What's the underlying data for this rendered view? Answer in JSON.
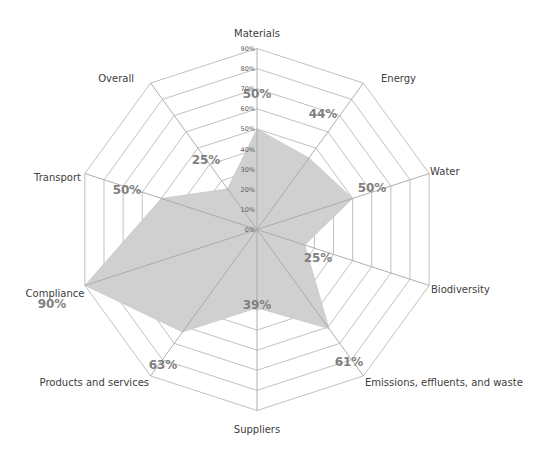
{
  "chart_data": {
    "type": "radar",
    "title": "",
    "categories": [
      "Materials",
      "Energy",
      "Water",
      "Biodiversity",
      "Emissions, effluents, and waste",
      "Suppliers",
      "Products and services",
      "Compliance",
      "Transport",
      "Overall"
    ],
    "series": [
      {
        "name": "Score",
        "values": [
          50,
          44,
          50,
          25,
          61,
          39,
          63,
          90,
          50,
          25
        ]
      }
    ],
    "data_labels": [
      "50%",
      "44%",
      "50%",
      "25%",
      "61%",
      "39%",
      "63%",
      "90%",
      "50%",
      "25%"
    ],
    "radial_ticks": [
      "0%",
      "10%",
      "20%",
      "30%",
      "40%",
      "50%",
      "60%",
      "70%",
      "80%",
      "90%"
    ],
    "rlim": [
      0,
      90
    ],
    "grid": true,
    "legend": "none"
  },
  "style": {
    "fill_color": "#d0d0d0",
    "axis_color": "#a6a6a6",
    "grid_color": "#b0b0b0",
    "label_color": "#404040",
    "data_label_color": "#7f7f7f"
  }
}
